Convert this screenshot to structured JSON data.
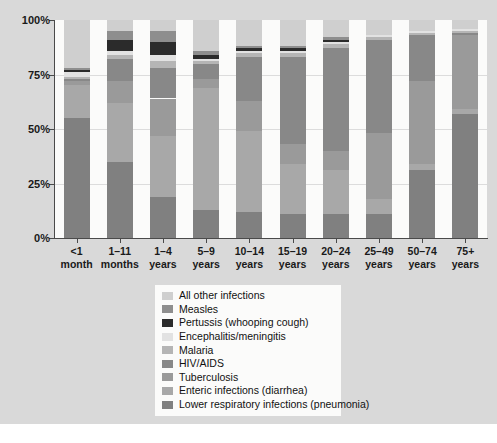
{
  "chart_data": {
    "type": "bar",
    "stacked": true,
    "normalized": "100%",
    "title": "",
    "subtitle": "",
    "xlabel": "",
    "ylabel": "",
    "ylim": [
      0,
      100
    ],
    "ytick_labels": [
      "0%",
      "25%",
      "50%",
      "75%",
      "100%"
    ],
    "ytick_values": [
      0,
      25,
      50,
      75,
      100
    ],
    "grid": true,
    "legend_position": "bottom-center",
    "categories": [
      "<1 month",
      "1–11 months",
      "1–4 years",
      "5–9 years",
      "10–14 years",
      "15–19 years",
      "20–24 years",
      "25–49 years",
      "50–74 years",
      "75+ years"
    ],
    "category_lines": [
      [
        "<1",
        "month"
      ],
      [
        "1–11",
        "months"
      ],
      [
        "1–4",
        "years"
      ],
      [
        "5–9",
        "years"
      ],
      [
        "10–14",
        "years"
      ],
      [
        "15–19",
        "years"
      ],
      [
        "20–24",
        "years"
      ],
      [
        "25–49",
        "years"
      ],
      [
        "50–74",
        "years"
      ],
      [
        "75+",
        "years"
      ]
    ],
    "series": [
      {
        "name": "Lower respiratory infections (pneumonia)",
        "color": "#808080",
        "values": [
          55,
          35,
          19,
          13,
          12,
          11,
          11,
          11,
          31,
          57
        ]
      },
      {
        "name": "Enteric infections (diarrhea)",
        "color": "#a8a8a8",
        "values": [
          15,
          27,
          28,
          56,
          37,
          23,
          20,
          7,
          3,
          2
        ]
      },
      {
        "name": "Tuberculosis",
        "color": "#9a9a9a",
        "values": [
          2,
          10,
          17,
          4,
          14,
          9,
          9,
          30,
          38,
          34
        ]
      },
      {
        "name": "HIV/AIDS",
        "color": "#888888",
        "values": [
          1,
          10,
          14,
          7,
          20,
          40,
          47,
          43,
          21,
          1
        ]
      },
      {
        "name": "Malaria",
        "color": "#b5b5b5",
        "values": [
          1,
          2,
          3,
          1,
          2,
          2,
          2,
          1,
          1,
          1
        ]
      },
      {
        "name": "Encephalitis/meningitis",
        "color": "#e2e2e2",
        "values": [
          2,
          2,
          3,
          1,
          1,
          1,
          1,
          1,
          1,
          1
        ]
      },
      {
        "name": "Pertussis (whooping cough)",
        "color": "#2b2b2b",
        "values": [
          1,
          5,
          6,
          2,
          1,
          1,
          1,
          0,
          0,
          0
        ]
      },
      {
        "name": "Measles",
        "color": "#8e8e8e",
        "values": [
          1,
          4,
          5,
          2,
          1,
          1,
          1,
          0,
          0,
          0
        ]
      },
      {
        "name": "All other infections",
        "color": "#cfcfcf",
        "values": [
          22,
          5,
          5,
          14,
          12,
          12,
          8,
          7,
          5,
          4
        ]
      }
    ],
    "legend_order": [
      "All other infections",
      "Measles",
      "Pertussis (whooping cough)",
      "Encephalitis/meningitis",
      "Malaria",
      "HIV/AIDS",
      "Tuberculosis",
      "Enteric infections (diarrhea)",
      "Lower respiratory infections (pneumonia)"
    ],
    "colors": {
      "all_other_infections": "#cfcfcf",
      "measles": "#8e8e8e",
      "pertussis": "#2b2b2b",
      "encephalitis_meningitis": "#e2e2e2",
      "malaria": "#b5b5b5",
      "hiv_aids": "#888888",
      "tuberculosis": "#9a9a9a",
      "enteric_infections": "#a8a8a8",
      "lower_respiratory_infections": "#808080",
      "figure_background": "#d9d9d9",
      "plot_background": "#fbfbfa",
      "axis": "#4a4a4a",
      "gridline": "#dcdcdc"
    }
  }
}
